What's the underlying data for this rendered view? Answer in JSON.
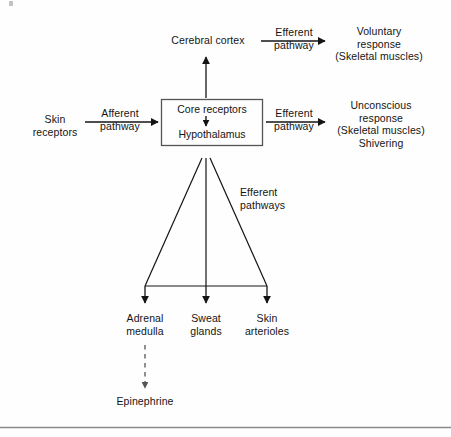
{
  "figure": {
    "type": "flow-diagram",
    "nodes": {
      "skin_receptors": "Skin\nreceptors",
      "cerebral_cortex": "Cerebral cortex",
      "core_box_line1": "Core receptors",
      "core_box_line2": "Hypothalamus",
      "voluntary_response": "Voluntary\nresponse\n(Skeletal muscles)",
      "unconscious_response": "Unconscious\nresponse\n(Skeletal muscles)\nShivering",
      "adrenal_medulla": "Adrenal\nmedulla",
      "sweat_glands": "Sweat\nglands",
      "skin_arterioles": "Skin\narterioles",
      "epinephrine": "Epinephrine"
    },
    "edge_labels": {
      "afferent": "Afferent\npathway",
      "efferent_cortex": "Efferent\npathway",
      "efferent_unconscious": "Efferent\npathway",
      "efferent_pathways_fan": "Efferent\npathways"
    },
    "colors": {
      "ink": "#141414",
      "background": "#fefefe",
      "box_stroke": "#555555",
      "frame_rule": "#8a8a8a"
    }
  }
}
